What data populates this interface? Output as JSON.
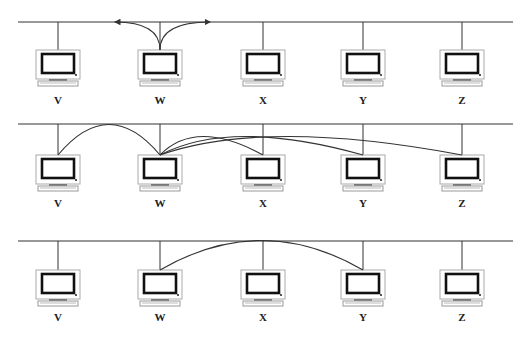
{
  "diagram": {
    "type": "network-bus",
    "colors": {
      "line": "#333333",
      "monitor_frame": "#999999",
      "screen_border": "#111111",
      "background": "#ffffff"
    },
    "stations": [
      {
        "id": "V",
        "label": "V",
        "x": 58
      },
      {
        "id": "W",
        "label": "W",
        "x": 160
      },
      {
        "id": "X",
        "label": "X",
        "x": 263
      },
      {
        "id": "Y",
        "label": "Y",
        "x": 363
      },
      {
        "id": "Z",
        "label": "Z",
        "x": 462
      }
    ],
    "rows": [
      {
        "name": "row-1",
        "bus_y": 22,
        "monitor_top": 50,
        "label_y": 104,
        "curves": [
          {
            "from": "W",
            "to_bus_x": 115,
            "direction": "left",
            "arrow": true
          },
          {
            "from": "W",
            "to_bus_x": 210,
            "direction": "right",
            "arrow": true
          }
        ]
      },
      {
        "name": "row-2",
        "bus_y": 124,
        "monitor_top": 155,
        "label_y": 207,
        "curves": [
          {
            "from": "W",
            "to": "V"
          },
          {
            "from": "W",
            "to": "X"
          },
          {
            "from": "W",
            "to": "Y"
          },
          {
            "from": "W",
            "to": "Z"
          }
        ]
      },
      {
        "name": "row-3",
        "bus_y": 241,
        "monitor_top": 270,
        "label_y": 321,
        "curves": [
          {
            "from": "W",
            "to": "Y"
          }
        ]
      }
    ]
  }
}
